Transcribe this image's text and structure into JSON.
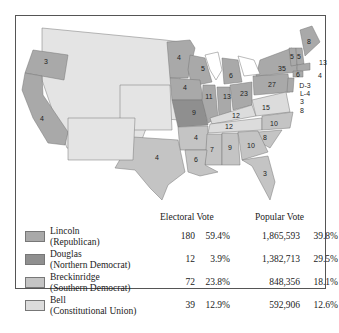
{
  "map": {
    "title": "Election of 1860",
    "states": [
      {
        "name": "Oregon",
        "ev": "3",
        "party": "lincoln"
      },
      {
        "name": "California",
        "ev": "4",
        "party": "lincoln"
      },
      {
        "name": "Minnesota",
        "ev": "4",
        "party": "lincoln"
      },
      {
        "name": "Wisconsin",
        "ev": "5",
        "party": "lincoln"
      },
      {
        "name": "Michigan",
        "ev": "6",
        "party": "lincoln"
      },
      {
        "name": "Iowa",
        "ev": "4",
        "party": "lincoln"
      },
      {
        "name": "Illinois",
        "ev": "11",
        "party": "lincoln"
      },
      {
        "name": "Indiana",
        "ev": "13",
        "party": "lincoln"
      },
      {
        "name": "Ohio",
        "ev": "23",
        "party": "lincoln"
      },
      {
        "name": "Pennsylvania",
        "ev": "27",
        "party": "lincoln"
      },
      {
        "name": "New York",
        "ev": "35",
        "party": "lincoln"
      },
      {
        "name": "Vermont",
        "ev": "5",
        "party": "lincoln"
      },
      {
        "name": "New Hampshire",
        "ev": "5",
        "party": "lincoln"
      },
      {
        "name": "Maine",
        "ev": "8",
        "party": "lincoln"
      },
      {
        "name": "Massachusetts",
        "ev": "13",
        "party": "lincoln"
      },
      {
        "name": "Rhode Island",
        "ev": "4",
        "party": "lincoln"
      },
      {
        "name": "Connecticut",
        "ev": "6",
        "party": "lincoln"
      },
      {
        "name": "New Jersey",
        "ev": "D-3 L-4",
        "party": "split"
      },
      {
        "name": "Missouri",
        "ev": "9",
        "party": "douglas"
      },
      {
        "name": "Delaware",
        "ev": "3",
        "party": "breckinridge"
      },
      {
        "name": "Maryland",
        "ev": "8",
        "party": "breckinridge"
      },
      {
        "name": "Kentucky",
        "ev": "12",
        "party": "bell"
      },
      {
        "name": "Virginia",
        "ev": "15",
        "party": "bell"
      },
      {
        "name": "Tennessee",
        "ev": "12",
        "party": "bell"
      },
      {
        "name": "North Carolina",
        "ev": "10",
        "party": "breckinridge"
      },
      {
        "name": "South Carolina",
        "ev": "8",
        "party": "breckinridge"
      },
      {
        "name": "Georgia",
        "ev": "10",
        "party": "breckinridge"
      },
      {
        "name": "Alabama",
        "ev": "9",
        "party": "breckinridge"
      },
      {
        "name": "Mississippi",
        "ev": "7",
        "party": "breckinridge"
      },
      {
        "name": "Louisiana",
        "ev": "6",
        "party": "breckinridge"
      },
      {
        "name": "Arkansas",
        "ev": "4",
        "party": "breckinridge"
      },
      {
        "name": "Texas",
        "ev": "4",
        "party": "breckinridge"
      },
      {
        "name": "Florida",
        "ev": "3",
        "party": "breckinridge"
      }
    ]
  },
  "colors": {
    "lincoln": "#a9a9a9",
    "douglas": "#8f8f8f",
    "breckinridge": "#c4c4c4",
    "bell": "#dcdcdc",
    "territory": "#e4e4e4"
  },
  "table": {
    "electoral_header": "Electoral Vote",
    "popular_header": "Popular Vote",
    "rows": [
      {
        "name": "Lincoln",
        "party": "(Republican)",
        "ev": "180",
        "ev_pct": "59.4%",
        "pv": "1,865,593",
        "pv_pct": "39.8%"
      },
      {
        "name": "Douglas",
        "party": "(Northern Democrat)",
        "ev": "12",
        "ev_pct": "3.9%",
        "pv": "1,382,713",
        "pv_pct": "29.5%"
      },
      {
        "name": "Breckinridge",
        "party": "(Southern Democrat)",
        "ev": "72",
        "ev_pct": "23.8%",
        "pv": "848,356",
        "pv_pct": "18.1%"
      },
      {
        "name": "Bell",
        "party": "(Constitutional Union)",
        "ev": "39",
        "ev_pct": "12.9%",
        "pv": "592,906",
        "pv_pct": "12.6%"
      }
    ]
  }
}
